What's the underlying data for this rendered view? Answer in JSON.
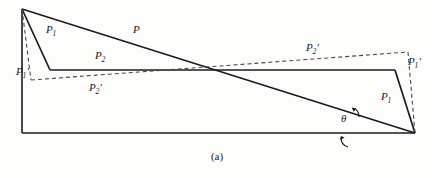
{
  "figure": {
    "caption": "(a)",
    "colors": {
      "solid_line": "#1b1b1b",
      "dashed_line": "#4a4a4a",
      "background": "#fdfdfc",
      "text": "#1a1a1a"
    },
    "labels": [
      {
        "id": "p1-left",
        "base": "P",
        "sub": "1",
        "prime": "",
        "text": "P1",
        "x": 46,
        "y": 30
      },
      {
        "id": "p-diagonal",
        "base": "P",
        "sub": "",
        "prime": "",
        "text": "P",
        "x": 133,
        "y": 30
      },
      {
        "id": "p2-left",
        "base": "P",
        "sub": "2",
        "prime": "",
        "text": "P2",
        "x": 95,
        "y": 56
      },
      {
        "id": "p1-prime-left",
        "base": "P",
        "sub": "1",
        "prime": "'",
        "text": "P1'",
        "x": 16,
        "y": 72
      },
      {
        "id": "p2-prime-left",
        "base": "P",
        "sub": "2",
        "prime": "'",
        "text": "P2'",
        "x": 89,
        "y": 88
      },
      {
        "id": "p2-prime-right",
        "base": "P",
        "sub": "2",
        "prime": "'",
        "text": "P2'",
        "x": 306,
        "y": 48
      },
      {
        "id": "p1-prime-right",
        "base": "P",
        "sub": "1",
        "prime": "'",
        "text": "P1'",
        "x": 408,
        "y": 62
      },
      {
        "id": "p1-right",
        "base": "P",
        "sub": "1",
        "prime": "",
        "text": "P1",
        "x": 381,
        "y": 97
      },
      {
        "id": "theta-angle",
        "base": "θ",
        "sub": "",
        "prime": "",
        "text": "θ",
        "x": 341,
        "y": 119
      }
    ],
    "geometry": {
      "apex_top_left": [
        22,
        9
      ],
      "bottom_left": [
        22,
        133
      ],
      "bottom_right": [
        415,
        133
      ],
      "crossing_point": [
        218,
        70
      ],
      "solid_p1_left_end": [
        50,
        70
      ],
      "solid_p1_right_start": [
        395,
        70
      ],
      "dashed_p1_prime_left_end": [
        31,
        80
      ],
      "dashed_p1_prime_right_top": [
        408,
        52
      ],
      "p2_line_y": 70,
      "theta_angle_vertex": [
        415,
        133
      ]
    }
  }
}
